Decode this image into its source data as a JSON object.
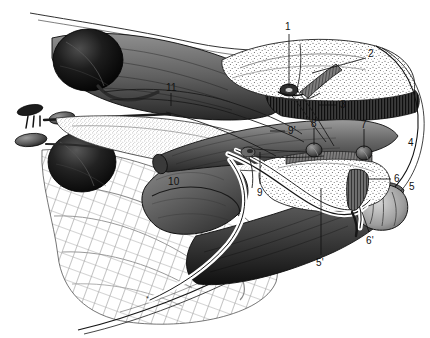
{
  "figure": {
    "kind": "anatomical-illustration",
    "style": "black-and-white stipple/hatch engraving",
    "width": 430,
    "height": 338,
    "background_color": "#ffffff",
    "ink_color": "#111111",
    "caption": ""
  },
  "labels": [
    {
      "id": "1",
      "text": "1",
      "x": 285,
      "y": 22,
      "leader": {
        "x1": 289,
        "y1": 34,
        "x2": 289,
        "y2": 86
      }
    },
    {
      "id": "2",
      "text": "2",
      "x": 368,
      "y": 49,
      "leader": {
        "x1": 366,
        "y1": 58,
        "x2": 312,
        "y2": 73
      }
    },
    {
      "id": "3",
      "text": "3",
      "x": 340,
      "y": 100,
      "leader": {
        "x1": 337,
        "y1": 105,
        "x2": 318,
        "y2": 105
      }
    },
    {
      "id": "4",
      "text": "4",
      "x": 408,
      "y": 138,
      "leader": null
    },
    {
      "id": "5",
      "text": "5",
      "x": 409,
      "y": 182,
      "leader": null
    },
    {
      "id": "5p",
      "text": "5'",
      "x": 316,
      "y": 258,
      "leader": {
        "x1": 321,
        "y1": 255,
        "x2": 321,
        "y2": 188
      }
    },
    {
      "id": "6",
      "text": "6",
      "x": 394,
      "y": 174,
      "leader": {
        "x1": 391,
        "y1": 179,
        "x2": 368,
        "y2": 179
      }
    },
    {
      "id": "6p",
      "text": "6'",
      "x": 366,
      "y": 236,
      "leader": {
        "x1": 369,
        "y1": 232,
        "x2": 362,
        "y2": 212
      }
    },
    {
      "id": "7",
      "text": "7",
      "x": 361,
      "y": 120,
      "leader": {
        "x1": 364,
        "y1": 129,
        "x2": 364,
        "y2": 148
      }
    },
    {
      "id": "8",
      "text": "8",
      "x": 311,
      "y": 119,
      "leader": {
        "x1": 314,
        "y1": 128,
        "x2": 314,
        "y2": 145
      }
    },
    {
      "id": "9",
      "text": "9",
      "x": 257,
      "y": 188,
      "leader": {
        "x1": 260,
        "y1": 184,
        "x2": 260,
        "y2": 152
      }
    },
    {
      "id": "9p",
      "text": "9'",
      "x": 288,
      "y": 126,
      "leader": {
        "x1": 285,
        "y1": 131,
        "x2": 270,
        "y2": 131
      }
    },
    {
      "id": "10",
      "text": "10",
      "x": 168,
      "y": 177,
      "leader": null
    },
    {
      "id": "11",
      "text": "11",
      "x": 166,
      "y": 83,
      "leader": {
        "x1": 171,
        "y1": 93,
        "x2": 171,
        "y2": 106
      }
    }
  ],
  "marks": [
    {
      "id": "asterisk",
      "text": "*",
      "x": 148,
      "y": 298
    }
  ]
}
